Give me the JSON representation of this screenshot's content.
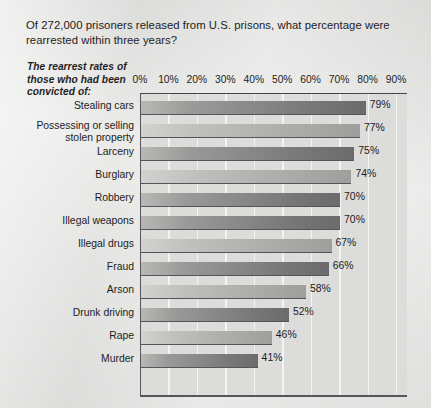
{
  "figure": {
    "title": "Of 272,000 prisoners released from U.S. prisons, what percentage were rearrested within three years?",
    "subtitle": "The rearrest rates of those who had been convicted of:",
    "background_color": "#e4e4e2",
    "plot_background_color": "#dcdcda",
    "gridline_color": "#f4f4f2",
    "axis_color": "#56565a",
    "text_color": "#1c1c1c",
    "bar_dark_color": "#8a8a8a",
    "bar_light_color": "#b2b2b0"
  },
  "chart_data": {
    "type": "bar",
    "orientation": "horizontal",
    "title": "Of 272,000 prisoners released from U.S. prisons, what percentage were rearrested within three years?",
    "subtitle": "The rearrest rates of those who had been convicted of:",
    "xlabel": "",
    "ylabel": "",
    "xlim": [
      0,
      90
    ],
    "grid": true,
    "legend": "none",
    "value_suffix": "%",
    "xticks": [
      0,
      10,
      20,
      30,
      40,
      50,
      60,
      70,
      80,
      90
    ],
    "xticklabels": [
      "0%",
      "10%",
      "20%",
      "30%",
      "40%",
      "50%",
      "60%",
      "70%",
      "80%",
      "90%"
    ],
    "categories": [
      "Stealing cars",
      "Possessing or selling\nstolen property",
      "Larceny",
      "Burglary",
      "Robbery",
      "Illegal weapons",
      "Illegal drugs",
      "Fraud",
      "Arson",
      "Drunk driving",
      "Rape",
      "Murder"
    ],
    "values": [
      79,
      77,
      75,
      74,
      70,
      70,
      67,
      66,
      58,
      52,
      46,
      41
    ],
    "value_labels": [
      "79%",
      "77%",
      "75%",
      "74%",
      "70%",
      "70%",
      "67%",
      "66%",
      "58%",
      "52%",
      "46%",
      "41%"
    ],
    "bar_shades": [
      "dark",
      "light",
      "dark",
      "light",
      "dark",
      "dark",
      "light",
      "dark",
      "light",
      "dark",
      "light",
      "dark"
    ],
    "total_prisoners": "272,000",
    "followup_years": "three years"
  }
}
